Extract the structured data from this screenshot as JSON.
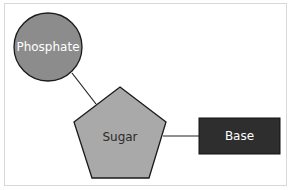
{
  "diagram": {
    "nodes": [
      {
        "id": "phosphate",
        "label": "Phosphate",
        "shape": "circle",
        "fill": "#8c8c8c",
        "text_color": "#ffffff"
      },
      {
        "id": "sugar",
        "label": "Sugar",
        "shape": "pentagon",
        "fill": "#a9a9a9",
        "text_color": "#2b2b2b"
      },
      {
        "id": "base",
        "label": "Base",
        "shape": "rectangle",
        "fill": "#2e2e2e",
        "text_color": "#ffffff"
      }
    ],
    "edges": [
      {
        "from": "phosphate",
        "to": "sugar"
      },
      {
        "from": "sugar",
        "to": "base"
      }
    ]
  }
}
